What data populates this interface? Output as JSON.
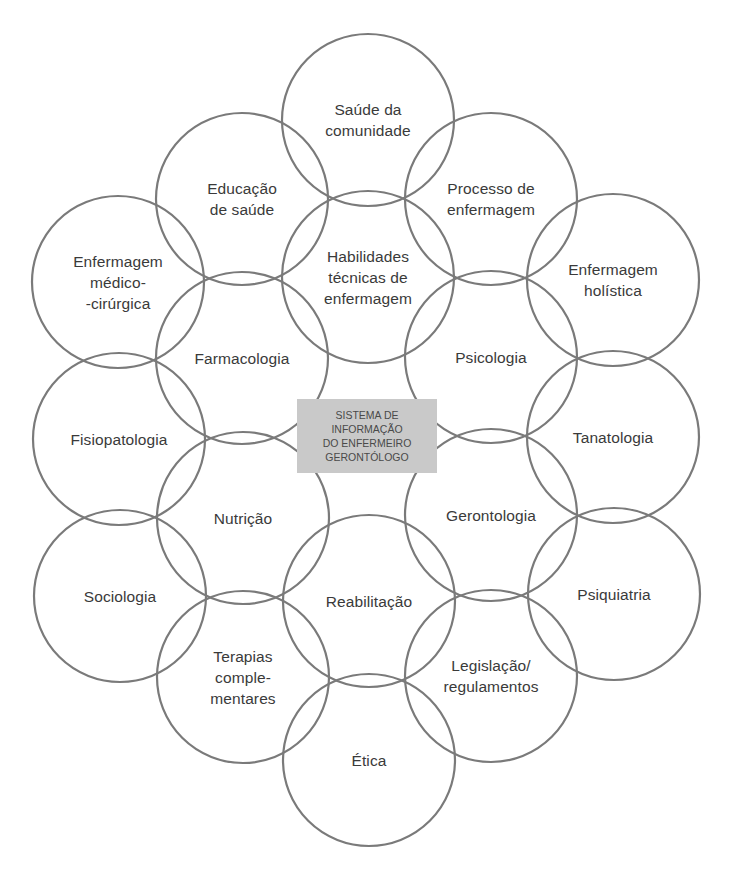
{
  "diagram": {
    "center": {
      "lines": [
        "SISTEMA DE",
        "INFORMAÇÃO",
        "DO ENFERMEIRO",
        "GERONTÓLOGO"
      ],
      "box": {
        "x": 297,
        "y": 399,
        "w": 140,
        "h": 74
      },
      "fill_color": "#c9c9c9"
    },
    "stroke_color": "#7a7a7a",
    "radius": 86,
    "circles": [
      {
        "id": "saude-comunidade",
        "cx": 368,
        "cy": 120,
        "lines": [
          "Saúde da",
          "comunidade"
        ]
      },
      {
        "id": "educacao-saude",
        "cx": 242,
        "cy": 199,
        "lines": [
          "Educação",
          "de saúde"
        ]
      },
      {
        "id": "processo-enfermagem",
        "cx": 491,
        "cy": 199,
        "lines": [
          "Processo de",
          "enfermagem"
        ]
      },
      {
        "id": "enfermagem-medico-cirurgica",
        "cx": 118,
        "cy": 282,
        "lines": [
          "Enfermagem",
          "médico-",
          "-cirúrgica"
        ]
      },
      {
        "id": "habilidades-tecnicas",
        "cx": 368,
        "cy": 277,
        "lines": [
          "Habilidades",
          "técnicas de",
          "enfermagem"
        ]
      },
      {
        "id": "enfermagem-holistica",
        "cx": 613,
        "cy": 280,
        "lines": [
          "Enfermagem",
          "holística"
        ]
      },
      {
        "id": "farmacologia",
        "cx": 242,
        "cy": 358,
        "lines": [
          "Farmacologia"
        ]
      },
      {
        "id": "psicologia",
        "cx": 491,
        "cy": 357,
        "lines": [
          "Psicologia"
        ]
      },
      {
        "id": "fisiopatologia",
        "cx": 119,
        "cy": 439,
        "lines": [
          "Fisiopatologia"
        ]
      },
      {
        "id": "tanatologia",
        "cx": 613,
        "cy": 437,
        "lines": [
          "Tanatologia"
        ]
      },
      {
        "id": "nutricao",
        "cx": 243,
        "cy": 518,
        "lines": [
          "Nutrição"
        ]
      },
      {
        "id": "gerontologia",
        "cx": 491,
        "cy": 515,
        "lines": [
          "Gerontologia"
        ]
      },
      {
        "id": "sociologia",
        "cx": 120,
        "cy": 596,
        "lines": [
          "Sociologia"
        ]
      },
      {
        "id": "reabilitacao",
        "cx": 369,
        "cy": 601,
        "lines": [
          "Reabilitação"
        ]
      },
      {
        "id": "psiquiatria",
        "cx": 614,
        "cy": 594,
        "lines": [
          "Psiquiatria"
        ]
      },
      {
        "id": "terapias-complementares",
        "cx": 243,
        "cy": 677,
        "lines": [
          "Terapias",
          "comple-",
          "mentares"
        ]
      },
      {
        "id": "legislacao-regulamentos",
        "cx": 491,
        "cy": 676,
        "lines": [
          "Legislação/",
          "regulamentos"
        ]
      },
      {
        "id": "etica",
        "cx": 369,
        "cy": 760,
        "lines": [
          "Ética"
        ]
      }
    ]
  }
}
